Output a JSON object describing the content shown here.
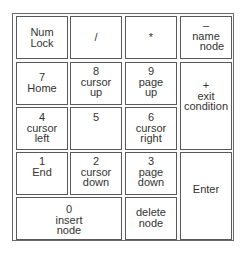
{
  "keypad": {
    "keys": [
      {
        "id": "numlock",
        "lines": [
          "Num",
          "Lock"
        ]
      },
      {
        "id": "divide",
        "lines": [
          "/"
        ]
      },
      {
        "id": "multiply",
        "lines": [
          "*"
        ]
      },
      {
        "id": "minus",
        "lines": [
          "–",
          "name",
          "node"
        ]
      },
      {
        "id": "seven",
        "lines": [
          "7",
          "Home"
        ]
      },
      {
        "id": "eight",
        "lines": [
          "8",
          "cursor",
          "up"
        ]
      },
      {
        "id": "nine",
        "lines": [
          "9",
          "page",
          "up"
        ]
      },
      {
        "id": "plus",
        "lines": [
          "+",
          "exit",
          "condition"
        ]
      },
      {
        "id": "four",
        "lines": [
          "4",
          "cursor",
          "left"
        ]
      },
      {
        "id": "five",
        "lines": [
          "5"
        ]
      },
      {
        "id": "six",
        "lines": [
          "6",
          "cursor",
          "right"
        ]
      },
      {
        "id": "one",
        "lines": [
          "1",
          "End"
        ]
      },
      {
        "id": "two",
        "lines": [
          "2",
          "cursor",
          "down"
        ]
      },
      {
        "id": "three",
        "lines": [
          "3",
          "page",
          "down"
        ]
      },
      {
        "id": "enter",
        "lines": [
          "Enter"
        ]
      },
      {
        "id": "zero",
        "lines": [
          "0",
          "insert",
          "node"
        ]
      },
      {
        "id": "decimal",
        "lines": [
          "delete",
          "node"
        ]
      }
    ]
  }
}
